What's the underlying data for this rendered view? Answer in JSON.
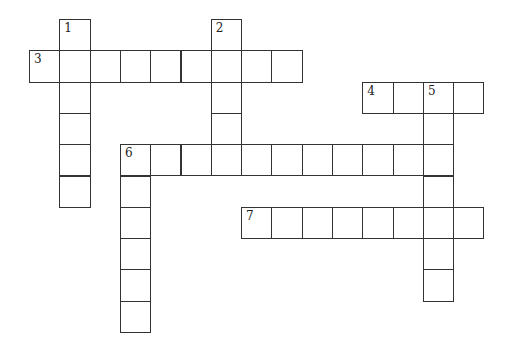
{
  "puzzle": {
    "type": "crossword",
    "cell_size": [
      30.3,
      31.3
    ],
    "origin": [
      29,
      19
    ],
    "entries": [
      {
        "number": "1",
        "direction": "down",
        "row": 0,
        "col": 1,
        "length": 6
      },
      {
        "number": "2",
        "direction": "down",
        "row": 0,
        "col": 6,
        "length": 5
      },
      {
        "number": "3",
        "direction": "across",
        "row": 1,
        "col": 0,
        "length": 9
      },
      {
        "number": "4",
        "direction": "across",
        "row": 2,
        "col": 11,
        "length": 4
      },
      {
        "number": "5",
        "direction": "down",
        "row": 2,
        "col": 13,
        "length": 7
      },
      {
        "number": "6",
        "direction": "across",
        "row": 4,
        "col": 3,
        "length": 11
      },
      {
        "number": "6",
        "direction": "down",
        "row": 4,
        "col": 3,
        "length": 6
      },
      {
        "number": "7",
        "direction": "across",
        "row": 6,
        "col": 7,
        "length": 8
      }
    ]
  }
}
